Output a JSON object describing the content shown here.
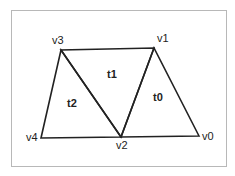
{
  "diagram": {
    "vertices": [
      {
        "id": "v0",
        "label": "v0",
        "x": 199,
        "y": 136
      },
      {
        "id": "v1",
        "label": "v1",
        "x": 154,
        "y": 48
      },
      {
        "id": "v2",
        "label": "v2",
        "x": 121,
        "y": 137
      },
      {
        "id": "v3",
        "label": "v3",
        "x": 61,
        "y": 50
      },
      {
        "id": "v4",
        "label": "v4",
        "x": 41,
        "y": 138
      }
    ],
    "triangles": [
      {
        "id": "t0",
        "label": "t0",
        "vertices": [
          "v0",
          "v1",
          "v2"
        ]
      },
      {
        "id": "t1",
        "label": "t1",
        "vertices": [
          "v1",
          "v2",
          "v3"
        ]
      },
      {
        "id": "t2",
        "label": "t2",
        "vertices": [
          "v2",
          "v3",
          "v4"
        ]
      }
    ],
    "stroke_color": "#222222",
    "frame_color": "#b8b8b8"
  }
}
